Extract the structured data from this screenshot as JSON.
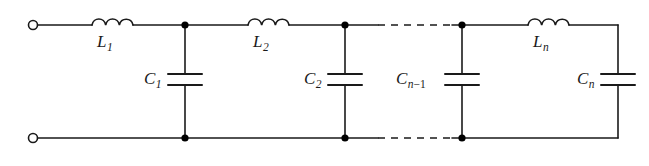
{
  "figure": {
    "kind": "circuit-schematic",
    "background_color": "#ffffff",
    "line_color": "#1a1a1a",
    "node_color": "#000000"
  },
  "terminals": {
    "top": {
      "name": "input-terminal-top",
      "x": 33,
      "y": 25,
      "radius": 4.5
    },
    "bottom": {
      "name": "input-terminal-bottom",
      "x": 33,
      "y": 138,
      "radius": 4.5
    }
  },
  "rails": {
    "top_y": 25,
    "bottom_y": 138,
    "left_x": 33,
    "right_x": 618
  },
  "nodes": [
    {
      "label": "node-1-top",
      "x": 185,
      "y": 25
    },
    {
      "label": "node-2-top",
      "x": 345,
      "y": 25
    },
    {
      "label": "node-3-top",
      "x": 462,
      "y": 25
    },
    {
      "label": "node-1-bottom",
      "x": 185,
      "y": 138
    },
    {
      "label": "node-2-bottom",
      "x": 345,
      "y": 138
    },
    {
      "label": "node-3-bottom",
      "x": 462,
      "y": 138
    }
  ],
  "inductors": [
    {
      "id": "L1",
      "label": "L",
      "subscript": "1",
      "x_start": 92,
      "x_end": 133,
      "humps": 3,
      "label_x": 98,
      "label_y": 40
    },
    {
      "id": "L2",
      "label": "L",
      "subscript": "2",
      "x_start": 248,
      "x_end": 289,
      "humps": 3,
      "label_x": 254,
      "label_y": 40
    },
    {
      "id": "Ln",
      "label": "L",
      "subscript": "n",
      "x_start": 528,
      "x_end": 569,
      "humps": 3,
      "label_x": 534,
      "label_y": 40
    }
  ],
  "capacitors": [
    {
      "id": "C1",
      "label": "C",
      "subscript": "1",
      "x": 185,
      "plate_top_y": 74,
      "plate_bottom_y": 85,
      "plate_half_width": 17,
      "label_x": 148,
      "label_y": 86
    },
    {
      "id": "C2",
      "label": "C",
      "subscript": "2",
      "x": 345,
      "plate_top_y": 74,
      "plate_bottom_y": 85,
      "plate_half_width": 17,
      "label_x": 308,
      "label_y": 86
    },
    {
      "id": "Cn-1",
      "label": "C",
      "subscript": "n−1",
      "x": 462,
      "plate_top_y": 74,
      "plate_bottom_y": 85,
      "plate_half_width": 17,
      "label_x": 408,
      "label_y": 86
    },
    {
      "id": "Cn",
      "label": "C",
      "subscript": "n",
      "x": 618,
      "plate_top_y": 74,
      "plate_bottom_y": 85,
      "plate_half_width": 17,
      "label_x": 581,
      "label_y": 86
    }
  ],
  "dashed_segments": [
    {
      "name": "top-continuation-dashes",
      "x_start": 378,
      "x_end": 452,
      "y": 25
    },
    {
      "name": "bottom-continuation-dashes",
      "x_start": 378,
      "x_end": 452,
      "y": 138
    }
  ],
  "labels": {
    "L1": "L",
    "L1_sub": "1",
    "L2": "L",
    "L2_sub": "2",
    "Ln": "L",
    "Ln_sub": "n",
    "C1": "C",
    "C1_sub": "1",
    "C2": "C",
    "C2_sub": "2",
    "Cn1": "C",
    "Cn1_sub_n": "n",
    "Cn1_sub_op": "−",
    "Cn1_sub_1": "1",
    "Cn": "C",
    "Cn_sub": "n"
  }
}
